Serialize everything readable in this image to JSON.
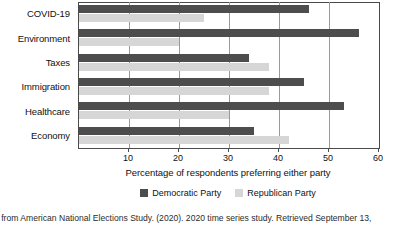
{
  "chart_data": {
    "type": "bar",
    "orientation": "horizontal",
    "title": "",
    "xlabel": "Percentage of respondents preferring either party",
    "ylabel": "",
    "xlim": [
      0,
      60
    ],
    "xticks": [
      0,
      10,
      20,
      30,
      40,
      50,
      60
    ],
    "xtick_labels": [
      "",
      "10",
      "20",
      "30",
      "40",
      "50",
      "60"
    ],
    "grid": true,
    "grid_axis": "x",
    "legend_position": "bottom-center",
    "categories": [
      "COVID-19",
      "Environment",
      "Taxes",
      "Immigration",
      "Healthcare",
      "Economy"
    ],
    "series": [
      {
        "name": "Democratic Party",
        "color": "#4d4d4d",
        "values": [
          46,
          56,
          34,
          45,
          53,
          35
        ]
      },
      {
        "name": "Republican Party",
        "color": "#d6d6d6",
        "values": [
          25,
          20,
          38,
          38,
          30,
          42
        ]
      }
    ]
  },
  "axis": {
    "title": "Percentage of respondents preferring either party"
  },
  "legend": {
    "items": [
      {
        "label": "Democratic Party",
        "color": "#4d4d4d"
      },
      {
        "label": "Republican Party",
        "color": "#d6d6d6"
      }
    ]
  },
  "caption": {
    "text": "a from American National Elections Study. (2020). 2020 time series study. Retrieved September 13,"
  }
}
